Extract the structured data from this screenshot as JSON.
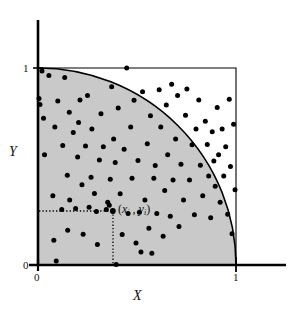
{
  "figure": {
    "background_color": "#ffffff",
    "region_fill_color": "#c9c9c9",
    "line_color": "#000000",
    "point_color": "#000000"
  },
  "labels": {
    "x_axis": "X",
    "y_axis": "Y",
    "point_annotation_open": "(",
    "point_annotation_x": "x",
    "point_annotation_x_sub": "i",
    "point_annotation_sep": " , ",
    "point_annotation_y": "y",
    "point_annotation_y_sub": "i",
    "point_annotation_close": ")"
  },
  "ticks": {
    "y_top": "1",
    "y_bottom": "0",
    "x_left": "0",
    "x_right": "1"
  },
  "chart_data": {
    "type": "scatter",
    "title": "",
    "xlabel": "X",
    "ylabel": "Y",
    "xlim": [
      0,
      1
    ],
    "ylim": [
      0,
      1
    ],
    "xticks": [
      0,
      1
    ],
    "yticks": [
      0,
      1
    ],
    "grid": false,
    "legend": null,
    "annotations": [
      {
        "text": "(x_i , y_i)",
        "x": 0.378,
        "y": 0.274,
        "leader_lines": [
          "horizontal dotted from y-axis",
          "vertical dotted to x-axis"
        ]
      }
    ],
    "shapes": [
      {
        "kind": "rect",
        "note": "unit square outline",
        "x0": 0,
        "y0": 0,
        "x1": 1,
        "y1": 1,
        "fill": "none",
        "stroke": "#000000"
      },
      {
        "kind": "quarter_circle",
        "note": "quarter disk of radius 1 centered at origin, shaded",
        "center": [
          0,
          0
        ],
        "radius": 1,
        "fill": "#c9c9c9",
        "stroke": "#000000"
      }
    ],
    "marker": {
      "shape": "circle",
      "size_px": 5,
      "color": "#000000"
    },
    "series": [
      {
        "name": "random points",
        "points": [
          [
            0.005,
            0.845
          ],
          [
            0.01,
            0.815
          ],
          [
            0.02,
            0.985
          ],
          [
            0.028,
            0.745
          ],
          [
            0.033,
            0.56
          ],
          [
            0.055,
            0.962
          ],
          [
            0.075,
            0.352
          ],
          [
            0.08,
            0.126
          ],
          [
            0.085,
            0.7
          ],
          [
            0.092,
            0.02
          ],
          [
            0.1,
            0.833
          ],
          [
            0.12,
            0.282
          ],
          [
            0.125,
            0.606
          ],
          [
            0.135,
            0.952
          ],
          [
            0.148,
            0.455
          ],
          [
            0.15,
            0.177
          ],
          [
            0.158,
            0.776
          ],
          [
            0.16,
            0.33
          ],
          [
            0.178,
            0.673
          ],
          [
            0.19,
            0.287
          ],
          [
            0.2,
            0.548
          ],
          [
            0.205,
            0.723
          ],
          [
            0.212,
            0.838
          ],
          [
            0.222,
            0.407
          ],
          [
            0.228,
            0.156
          ],
          [
            0.24,
            0.604
          ],
          [
            0.25,
            0.86
          ],
          [
            0.258,
            0.293
          ],
          [
            0.268,
            0.445
          ],
          [
            0.272,
            0.69
          ],
          [
            0.285,
            0.363
          ],
          [
            0.295,
            0.272
          ],
          [
            0.3,
            0.104
          ],
          [
            0.31,
            0.533
          ],
          [
            0.318,
            0.768
          ],
          [
            0.33,
            0.6
          ],
          [
            0.345,
            0.282
          ],
          [
            0.352,
            0.318
          ],
          [
            0.36,
            0.303
          ],
          [
            0.365,
            0.435
          ],
          [
            0.372,
            0.905
          ],
          [
            0.378,
            0.274
          ],
          [
            0.382,
            0.64
          ],
          [
            0.39,
            0.52
          ],
          [
            0.395,
            0.002
          ],
          [
            0.405,
            0.797
          ],
          [
            0.415,
            0.362
          ],
          [
            0.425,
            0.155
          ],
          [
            0.435,
            0.588
          ],
          [
            0.448,
            1.0
          ],
          [
            0.455,
            0.262
          ],
          [
            0.468,
            0.7
          ],
          [
            0.475,
            0.44
          ],
          [
            0.485,
            0.836
          ],
          [
            0.495,
            0.112
          ],
          [
            0.505,
            0.53
          ],
          [
            0.512,
            0.268
          ],
          [
            0.52,
            0.066
          ],
          [
            0.528,
            0.88
          ],
          [
            0.54,
            0.33
          ],
          [
            0.552,
            0.615
          ],
          [
            0.56,
            0.186
          ],
          [
            0.568,
            0.757
          ],
          [
            0.575,
            0.06
          ],
          [
            0.585,
            0.44
          ],
          [
            0.592,
            0.505
          ],
          [
            0.6,
            0.262
          ],
          [
            0.612,
            0.89
          ],
          [
            0.62,
            0.7
          ],
          [
            0.632,
            0.146
          ],
          [
            0.64,
            0.378
          ],
          [
            0.648,
            0.812
          ],
          [
            0.655,
            0.56
          ],
          [
            0.668,
            0.248
          ],
          [
            0.675,
            0.918
          ],
          [
            0.682,
            0.432
          ],
          [
            0.695,
            0.64
          ],
          [
            0.705,
            0.86
          ],
          [
            0.712,
            0.196
          ],
          [
            0.722,
            0.512
          ],
          [
            0.735,
            0.33
          ],
          [
            0.745,
            0.76
          ],
          [
            0.752,
            0.894
          ],
          [
            0.765,
            0.432
          ],
          [
            0.778,
            0.61
          ],
          [
            0.79,
            0.255
          ],
          [
            0.798,
            0.69
          ],
          [
            0.812,
            0.838
          ],
          [
            0.82,
            0.506
          ],
          [
            0.832,
            0.352
          ],
          [
            0.845,
            0.73
          ],
          [
            0.855,
            0.612
          ],
          [
            0.862,
            0.452
          ],
          [
            0.872,
            0.24
          ],
          [
            0.88,
            0.676
          ],
          [
            0.888,
            0.528
          ],
          [
            0.895,
            0.4
          ],
          [
            0.905,
            0.8
          ],
          [
            0.912,
            0.56
          ],
          [
            0.92,
            0.318
          ],
          [
            0.93,
            0.69
          ],
          [
            0.938,
            0.452
          ],
          [
            0.948,
            0.6
          ],
          [
            0.958,
            0.258
          ],
          [
            0.966,
            0.842
          ],
          [
            0.972,
            0.5
          ],
          [
            0.98,
            0.158
          ],
          [
            0.988,
            0.714
          ],
          [
            0.995,
            0.382
          ]
        ]
      }
    ]
  }
}
